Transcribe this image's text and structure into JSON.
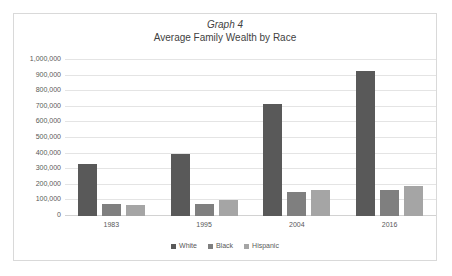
{
  "chart_data": {
    "type": "bar",
    "title": "Graph 4",
    "subtitle": "Average Family Wealth by Race",
    "xlabel": "",
    "ylabel": "",
    "categories": [
      "1983",
      "1995",
      "2004",
      "2016"
    ],
    "series": [
      {
        "name": "White",
        "color": "#595959",
        "values": [
          335000,
          400000,
          720000,
          930000
        ]
      },
      {
        "name": "Black",
        "color": "#7f7f7f",
        "values": [
          75000,
          75000,
          155000,
          165000
        ]
      },
      {
        "name": "Hispanic",
        "color": "#a5a5a5",
        "values": [
          72000,
          100000,
          165000,
          195000
        ]
      }
    ],
    "ylim": [
      0,
      1000000
    ],
    "ytick_step": 100000,
    "ytick_labels": [
      "0",
      "100,000",
      "200,000",
      "300,000",
      "400,000",
      "500,000",
      "600,000",
      "700,000",
      "800,000",
      "900,000",
      "1,000,000"
    ],
    "grid": true,
    "legend_position": "bottom",
    "plot_background": "#ffffff",
    "grid_color": "#e4e4e4",
    "border_color": "#d9d9d9"
  }
}
